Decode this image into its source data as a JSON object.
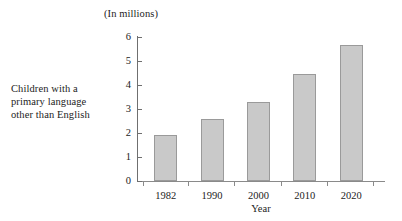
{
  "caption": {
    "line1": "Children with a",
    "line2": "primary language",
    "line3": "other than English"
  },
  "chart_data": {
    "type": "bar",
    "title": "(In millions)",
    "xlabel": "Year",
    "ylabel": "",
    "categories": [
      "1982",
      "1990",
      "2000",
      "2010",
      "2020"
    ],
    "values": [
      1.9,
      2.6,
      3.3,
      4.45,
      5.65
    ],
    "series": [
      {
        "name": "Children with a primary language other than English",
        "values": [
          1.9,
          2.6,
          3.3,
          4.45,
          5.65
        ]
      }
    ],
    "ylim": [
      0,
      6
    ],
    "ytick_labels": [
      "0",
      "1",
      "2",
      "3",
      "4",
      "5",
      "6"
    ],
    "ytick_values": [
      0,
      1,
      2,
      3,
      4,
      5,
      6
    ],
    "grid": false,
    "legend": false,
    "bar_color": "#c9c9c9",
    "bar_border_color": "#9a9a9a",
    "axis_color": "#8a8a8a",
    "text_color": "#232323",
    "background": "#ffffff",
    "units": "millions"
  }
}
